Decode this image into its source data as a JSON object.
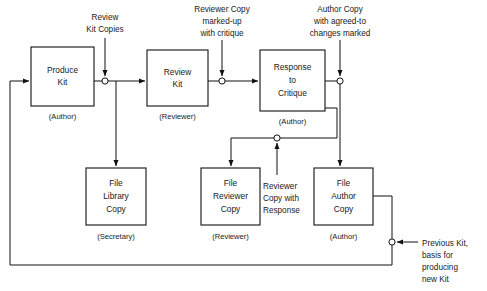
{
  "diagram": {
    "colors": {
      "stroke": "#111111",
      "text": "#1a1a1a",
      "background": "#ffffff"
    },
    "process_boxes": [
      {
        "id": "produce-kit",
        "lines": [
          "Produce",
          "Kit"
        ],
        "role": "(Author)",
        "x": 31,
        "y": 47,
        "w": 63,
        "h": 59
      },
      {
        "id": "review-kit",
        "lines": [
          "Review",
          "Kit"
        ],
        "role": "(Reviewer)",
        "x": 147,
        "y": 50,
        "w": 61,
        "h": 56
      },
      {
        "id": "response-to-critique",
        "lines": [
          "Response",
          "to",
          "Critique"
        ],
        "role": "(Author)",
        "x": 260,
        "y": 50,
        "w": 65,
        "h": 61
      },
      {
        "id": "file-library-copy",
        "lines": [
          "File",
          "Library",
          "Copy"
        ],
        "role": "(Secretary)",
        "x": 86,
        "y": 168,
        "w": 60,
        "h": 57
      },
      {
        "id": "file-reviewer-copy",
        "lines": [
          "File",
          "Reviewer",
          "Copy"
        ],
        "role": "(Reviewer)",
        "x": 201,
        "y": 168,
        "w": 59,
        "h": 57
      },
      {
        "id": "file-author-copy",
        "lines": [
          "File",
          "Author",
          "Copy"
        ],
        "role": "(Author)",
        "x": 314,
        "y": 168,
        "w": 59,
        "h": 57
      }
    ],
    "annotations": [
      {
        "id": "review-kit-copies",
        "lines": [
          "Review",
          "Kit Copies"
        ],
        "anchor": "middle",
        "x": 105,
        "y": 17
      },
      {
        "id": "reviewer-copy-marked-up",
        "lines": [
          "Reviewer Copy",
          "marked-up",
          "with critique"
        ],
        "anchor": "middle",
        "x": 222,
        "y": 10
      },
      {
        "id": "author-copy-agreed-to",
        "lines": [
          "Author Copy",
          "with agreed-to",
          "changes marked"
        ],
        "anchor": "middle",
        "x": 340,
        "y": 10
      },
      {
        "id": "reviewer-copy-with-response",
        "lines": [
          "Reviewer",
          "Copy with",
          "Response"
        ],
        "anchor": "start",
        "x": 263,
        "y": 186
      },
      {
        "id": "previous-kit",
        "lines": [
          "Previous Kit,",
          "basis for",
          "producing",
          "new Kit"
        ],
        "anchor": "start",
        "x": 422,
        "y": 244
      }
    ],
    "junctions": [
      {
        "id": "junction-review-kit-copies",
        "cx": 105,
        "cy": 81
      },
      {
        "id": "junction-reviewer-copy-critique",
        "cx": 222,
        "cy": 81
      },
      {
        "id": "junction-author-copy-changes",
        "cx": 340,
        "cy": 81
      },
      {
        "id": "junction-reviewer-copy-response",
        "cx": 277,
        "cy": 138
      },
      {
        "id": "junction-previous-kit",
        "cx": 392,
        "cy": 242
      }
    ]
  }
}
